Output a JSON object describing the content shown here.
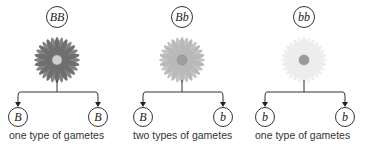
{
  "panels": [
    {
      "genotype": "BB",
      "flower_color": "#6f6f6f",
      "center_color": "#cfcfcf",
      "gametes": [
        "B",
        "B"
      ],
      "caption": "one type of gametes"
    },
    {
      "genotype": "Bb",
      "flower_color": "#b9b9b9",
      "center_color": "#9e9e9e",
      "gametes": [
        "B",
        "b"
      ],
      "caption": "two types of gametes"
    },
    {
      "genotype": "bb",
      "flower_color": "#ececec",
      "center_color": "#9a9a9a",
      "gametes": [
        "b",
        "b"
      ],
      "caption": "one type of gametes"
    }
  ]
}
